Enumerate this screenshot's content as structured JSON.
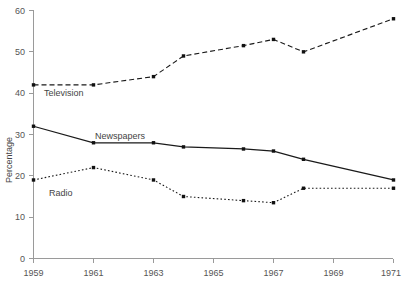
{
  "chart_data": {
    "type": "line",
    "title": "",
    "xlabel": "",
    "ylabel": "Percentage",
    "xlim": [
      1959,
      1971
    ],
    "ylim": [
      0,
      60
    ],
    "grid": false,
    "legend_position": "inline-labels",
    "x_tick_labels": [
      "1959",
      "1961",
      "1963",
      "1965",
      "1967",
      "1969",
      "1971"
    ],
    "x_tick_values": [
      1959,
      1961,
      1963,
      1965,
      1967,
      1969,
      1971
    ],
    "y_tick_labels": [
      "0",
      "10",
      "20",
      "30",
      "40",
      "50",
      "60"
    ],
    "y_tick_values": [
      0,
      10,
      20,
      30,
      40,
      50,
      60
    ],
    "x": [
      1959,
      1961,
      1963,
      1964,
      1966,
      1967,
      1968,
      1971
    ],
    "series": [
      {
        "name": "Television",
        "style": "dashed",
        "color": "#1a1a1a",
        "values": [
          42,
          42,
          44,
          49,
          51.5,
          53,
          50,
          58
        ],
        "label_text": "Television"
      },
      {
        "name": "Newspapers",
        "style": "solid",
        "color": "#1a1a1a",
        "values": [
          32,
          28,
          28,
          27,
          26.5,
          26,
          24,
          19
        ],
        "label_text": "Newspapers"
      },
      {
        "name": "Radio",
        "style": "dotted",
        "color": "#1a1a1a",
        "values": [
          19,
          22,
          19,
          15,
          14,
          13.5,
          17,
          17
        ],
        "label_text": "Radio"
      }
    ]
  },
  "axes": {
    "y_title": "Percentage"
  },
  "labels": {
    "television": "Television",
    "newspapers": "Newspapers",
    "radio": "Radio"
  },
  "x_ticks": {
    "t0": "1959",
    "t1": "1961",
    "t2": "1963",
    "t3": "1965",
    "t4": "1967",
    "t5": "1969",
    "t6": "1971"
  },
  "y_ticks": {
    "t0": "0",
    "t1": "10",
    "t2": "20",
    "t3": "30",
    "t4": "40",
    "t5": "50",
    "t6": "60"
  }
}
